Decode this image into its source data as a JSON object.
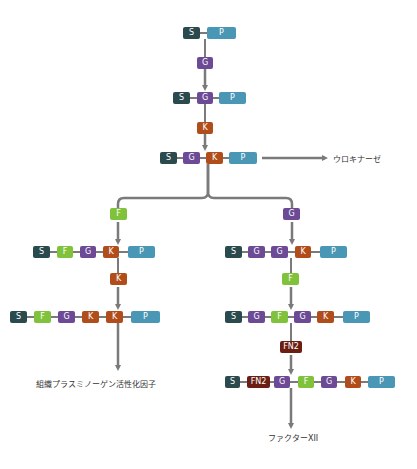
{
  "colors": {
    "S": "#2b4a4d",
    "P": "#4a97b5",
    "G": "#6c4a95",
    "K": "#b04d1a",
    "F": "#80c23c",
    "FN2": "#6a1f12",
    "connector": "#7a7a7a"
  },
  "domain_labels": {
    "S": "S",
    "P": "P",
    "G": "G",
    "K": "K",
    "F": "F",
    "FN2": "FN2"
  },
  "rows": [
    {
      "id": "row-sp",
      "domains": [
        "S",
        "P"
      ]
    },
    {
      "id": "row-sgp",
      "domains": [
        "S",
        "G",
        "P"
      ]
    },
    {
      "id": "row-sgkp",
      "domains": [
        "S",
        "G",
        "K",
        "P"
      ]
    },
    {
      "id": "row-sfgkp",
      "domains": [
        "S",
        "F",
        "G",
        "K",
        "P"
      ]
    },
    {
      "id": "row-sfgkkp",
      "domains": [
        "S",
        "F",
        "G",
        "K",
        "K",
        "P"
      ]
    },
    {
      "id": "row-sggkp",
      "domains": [
        "S",
        "G",
        "G",
        "K",
        "P"
      ]
    },
    {
      "id": "row-sgfgkp",
      "domains": [
        "S",
        "G",
        "F",
        "G",
        "K",
        "P"
      ]
    },
    {
      "id": "row-sfn2gfgkp",
      "domains": [
        "S",
        "FN2",
        "G",
        "F",
        "G",
        "K",
        "P"
      ]
    }
  ],
  "insertions": [
    {
      "id": "insert-g-1",
      "domain": "G"
    },
    {
      "id": "insert-k-1",
      "domain": "K"
    },
    {
      "id": "insert-f-left",
      "domain": "F"
    },
    {
      "id": "insert-g-right",
      "domain": "G"
    },
    {
      "id": "insert-k-left",
      "domain": "K"
    },
    {
      "id": "insert-f-right",
      "domain": "F"
    },
    {
      "id": "insert-fn2-right",
      "domain": "FN2"
    }
  ],
  "labels": {
    "urokinase": "ウロキナーゼ",
    "tpa": "組織プラスミノーゲン活性化因子",
    "factor12": "ファクターXII"
  }
}
